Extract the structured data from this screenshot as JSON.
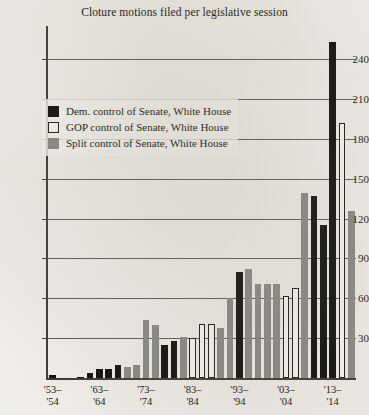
{
  "chart_data": {
    "type": "bar",
    "title": "Cloture motions filed per legislative session",
    "xlabel": "",
    "ylabel": "",
    "ylim": [
      0,
      265
    ],
    "yticks": [
      30,
      60,
      90,
      120,
      150,
      180,
      210,
      240
    ],
    "grid": true,
    "legend_position": "upper-left-inside",
    "legend": [
      {
        "key": "dem",
        "label": "Dem. control of Senate, White House",
        "color": "#0d0d0d"
      },
      {
        "key": "gop",
        "label": "GOP control of Senate, White House",
        "color": "#ffffff"
      },
      {
        "key": "split",
        "label": "Split control of Senate, White House",
        "color": "#8a8a88"
      }
    ],
    "xtick_labels": [
      {
        "line1": "'53–",
        "line2": "'54",
        "index": 0
      },
      {
        "line1": "'63–",
        "line2": "'64",
        "index": 5
      },
      {
        "line1": "'73–",
        "line2": "'74",
        "index": 10
      },
      {
        "line1": "'83–",
        "line2": "'84",
        "index": 15
      },
      {
        "line1": "'93–",
        "line2": "'94",
        "index": 20
      },
      {
        "line1": "'03–",
        "line2": "'04",
        "index": 25
      },
      {
        "line1": "'13–",
        "line2": "'14",
        "index": 30
      }
    ],
    "categories": [
      "'53–'54",
      "'55–'56",
      "'57–'58",
      "'59–'60",
      "'61–'62",
      "'63–'64",
      "'65–'66",
      "'67–'68",
      "'69–'70",
      "'71–'72",
      "'73–'74",
      "'75–'76",
      "'77–'78",
      "'79–'80",
      "'81–'82",
      "'83–'84",
      "'85–'86",
      "'87–'88",
      "'89–'90",
      "'91–'92",
      "'93–'94",
      "'95–'96",
      "'97–'98",
      "'99–'00",
      "'01–'02",
      "'03–'04",
      "'05–'06",
      "'07–'08",
      "'09–'10",
      "'11–'12",
      "'13–'14"
    ],
    "values": [
      2,
      0,
      0,
      1,
      4,
      7,
      7,
      10,
      8,
      10,
      44,
      40,
      25,
      28,
      31,
      30,
      41,
      41,
      38,
      60,
      80,
      82,
      71,
      71,
      71,
      62,
      68,
      139,
      137,
      115,
      253
    ],
    "bar_groups": [
      "dem",
      "dem",
      "dem",
      "dem",
      "dem",
      "dem",
      "dem",
      "dem",
      "split",
      "split",
      "split",
      "split",
      "dem",
      "dem",
      "split",
      "gop",
      "gop",
      "gop",
      "split",
      "split",
      "dem",
      "split",
      "split",
      "split",
      "split",
      "gop",
      "gop",
      "split",
      "dem",
      "dem",
      "dem"
    ],
    "extra_bars": [
      {
        "after_index": 30,
        "value": 192,
        "group": "gop"
      },
      {
        "after_index": 30,
        "value": 126,
        "group": "split"
      }
    ],
    "annotations": []
  }
}
